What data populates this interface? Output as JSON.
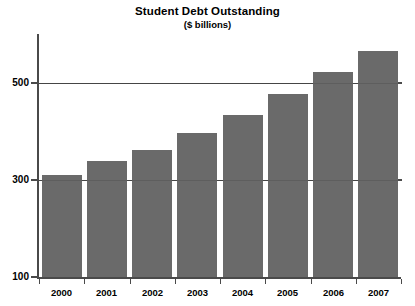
{
  "chart_data": {
    "type": "bar",
    "title": "Student Debt Outstanding",
    "subtitle": "($ billions)",
    "xlabel": "",
    "ylabel": "",
    "categories": [
      "2000",
      "2001",
      "2002",
      "2003",
      "2004",
      "2005",
      "2006",
      "2007"
    ],
    "values": [
      311,
      340,
      362,
      397,
      434,
      477,
      523,
      566
    ],
    "ylim": [
      100,
      600
    ],
    "yticks": [
      100,
      300,
      500
    ],
    "ytick_labels": [
      "100",
      "300",
      "500"
    ],
    "grid": true,
    "legend": false,
    "bar_color": "#6a6a6a",
    "axis_color": "#4a4a4a",
    "background": "#ffffff"
  },
  "figure": {
    "title": "Student Debt Outstanding",
    "subtitle": "($ billions)"
  }
}
